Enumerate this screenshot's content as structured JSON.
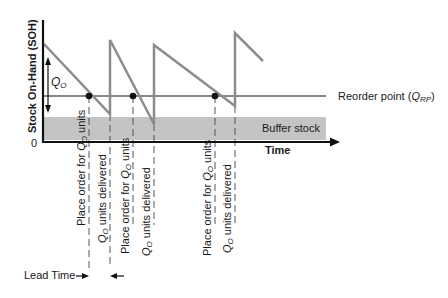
{
  "diagram": {
    "y_axis_label": "Stock On-Hand (SOH)",
    "y_zero_label": "0",
    "x_axis_label": "Time",
    "qo_label": "Q",
    "qo_sub": "O",
    "reorder_label": "Reorder point (",
    "reorder_q": "Q",
    "reorder_sub": "RP",
    "reorder_close": ")",
    "buffer_label": "Buffer stock",
    "lead_time_label": "Lead Time",
    "annotations": [
      {
        "text": "Place order for ",
        "q": "Q",
        "sub": "O",
        "tail": " units"
      },
      {
        "text": "",
        "q": "Q",
        "sub": "O",
        "tail": " units delivered"
      },
      {
        "text": "Place order for ",
        "q": "Q",
        "sub": "O",
        "tail": " units"
      },
      {
        "text": "",
        "q": "Q",
        "sub": "O",
        "tail": " units delivered"
      },
      {
        "text": "Place order for ",
        "q": "Q",
        "sub": "O",
        "tail": " units"
      },
      {
        "text": "",
        "q": "Q",
        "sub": "O",
        "tail": " units delivered"
      }
    ],
    "colors": {
      "sawtooth": "#8c8c8c",
      "buffer": "#c4c4c4",
      "axis": "#111111"
    }
  }
}
